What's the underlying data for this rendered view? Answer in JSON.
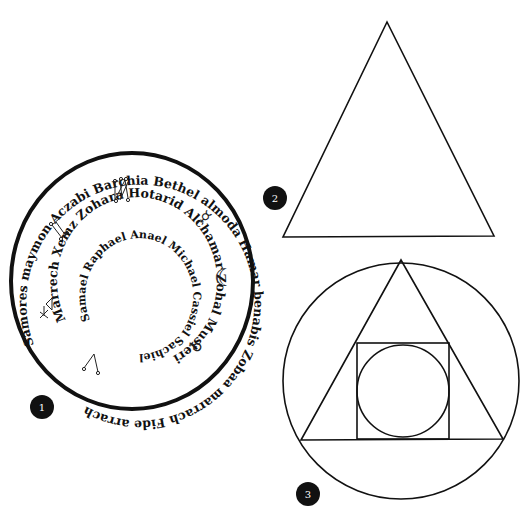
{
  "figures": [
    {
      "id": 1,
      "badge": "1",
      "type": "planetary-seal",
      "rings": {
        "outer": "Samores maymon Aczabi Barchia Bethel almoda Hamar benabis Zobaa marrach Fide arrach",
        "middle": "Marrech Xemz Zohara Hotarid Alchamar Zohal Musteri",
        "inner": "Samael Raphael Anael Michael Cassiel Sachiel"
      },
      "symbols": [
        "sigil-1",
        "sigil-2",
        "mercury-glyph",
        "moon-crescent",
        "venus-glyph",
        "jupiter-sigil",
        "mars-sigil"
      ]
    },
    {
      "id": 2,
      "badge": "2",
      "type": "triangle"
    },
    {
      "id": 3,
      "badge": "3",
      "type": "circle-triangle-square-circle"
    }
  ],
  "glyphs": {
    "moon": "☾",
    "mercury": "☿",
    "venus": "♀"
  },
  "colors": {
    "stroke": "#111111",
    "badge": "#111111",
    "background": "#ffffff"
  }
}
